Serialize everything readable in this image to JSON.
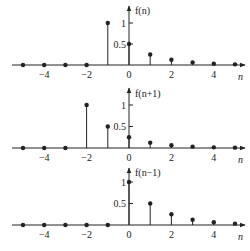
{
  "chart_data": [
    {
      "type": "stem",
      "title": "f(n)",
      "ylabel": "f(n)",
      "xlabel": "n",
      "x": [
        -5,
        -4,
        -3,
        -2,
        -1,
        0,
        1,
        2,
        3,
        4,
        5
      ],
      "values": [
        0,
        0,
        0,
        0,
        1,
        0.5,
        0.25,
        0.125,
        0.0625,
        0.03125,
        0.015625
      ],
      "xticks": [
        -4,
        -2,
        0,
        2,
        4
      ],
      "xtick_labels": [
        "−4",
        "−2",
        "0",
        "2",
        "4"
      ],
      "yticks": [
        0.5,
        1
      ],
      "ytick_labels": [
        "0.5",
        "1"
      ],
      "grid": false
    },
    {
      "type": "stem",
      "title": "f(n+1)",
      "ylabel": "f(n+1)",
      "xlabel": "n",
      "x": [
        -5,
        -4,
        -3,
        -2,
        -1,
        0,
        1,
        2,
        3,
        4,
        5
      ],
      "values": [
        0,
        0,
        0,
        1,
        0.5,
        0.25,
        0.125,
        0.0625,
        0.03125,
        0.015625,
        0.0078
      ],
      "xticks": [
        -4,
        -2,
        0,
        2,
        4
      ],
      "xtick_labels": [
        "−4",
        "−2",
        "0",
        "2",
        "4"
      ],
      "yticks": [
        0.5,
        1
      ],
      "ytick_labels": [
        "0.5",
        "1"
      ],
      "grid": false
    },
    {
      "type": "stem",
      "title": "f(n-1)",
      "ylabel": "f(n−1)",
      "xlabel": "n",
      "x": [
        -5,
        -4,
        -3,
        -2,
        -1,
        0,
        1,
        2,
        3,
        4,
        5
      ],
      "values": [
        0,
        0,
        0,
        0,
        0,
        1,
        0.5,
        0.25,
        0.125,
        0.0625,
        0.03125
      ],
      "xticks": [
        -4,
        -2,
        0,
        2,
        4
      ],
      "xtick_labels": [
        "−4",
        "−2",
        "0",
        "2",
        "4"
      ],
      "yticks": [
        0.5,
        1
      ],
      "ytick_labels": [
        "0.5",
        "1"
      ],
      "grid": false
    }
  ],
  "panels": [
    {
      "ylabel": "f(n)",
      "xlabel": "n"
    },
    {
      "ylabel": "f(n+1)",
      "xlabel": "n"
    },
    {
      "ylabel": "f(n−1)",
      "xlabel": "n"
    }
  ],
  "colors": {
    "ink": "#222222",
    "background": "#ffffff"
  }
}
